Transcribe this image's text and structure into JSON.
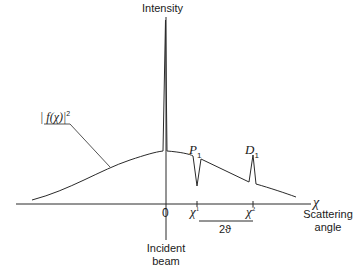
{
  "diagram": {
    "y_axis_label": "Intensity",
    "x_axis_symbol": "χ",
    "x_axis_label_line1": "Scattering",
    "x_axis_label_line2": "angle",
    "origin_label": "0",
    "incident_label_line1": "Incident",
    "incident_label_line2": "beam",
    "curve_label": "| f(χ)|²",
    "curve_label_f": "| f(χ)|",
    "curve_label_sup": "2",
    "peak_p": {
      "letter": "P",
      "sub": "1"
    },
    "peak_d": {
      "letter": "D",
      "sub": "1"
    },
    "tick_1": {
      "symbol": "χ",
      "sup": "1"
    },
    "tick_2": {
      "symbol": "χ",
      "sup": "2"
    },
    "interval_label": "2ϑ",
    "colors": {
      "line": "#2a2a2a",
      "background": "#ffffff"
    }
  }
}
